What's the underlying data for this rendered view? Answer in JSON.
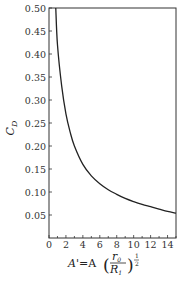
{
  "chart_data": {
    "type": "line",
    "title": "",
    "xlabel": "A' = A(r_0/R_1)^(1/2)",
    "ylabel": "C_D",
    "xlim": [
      0,
      15
    ],
    "ylim": [
      0,
      0.5
    ],
    "x_ticks": [
      0,
      2,
      4,
      6,
      8,
      10,
      12,
      14
    ],
    "x_tick_labels": [
      "0",
      "2",
      "4",
      "6",
      "8",
      "10",
      "12",
      "14"
    ],
    "y_ticks": [
      0.05,
      0.1,
      0.15,
      0.2,
      0.25,
      0.3,
      0.35,
      0.4,
      0.45,
      0.5
    ],
    "y_tick_labels": [
      "0.05",
      "0.10",
      "0.15",
      "0.20",
      "0.25",
      "0.30",
      "0.35",
      "0.40",
      "0.45",
      "0.50"
    ],
    "grid": false,
    "legend": null,
    "series": [
      {
        "name": "C_D",
        "x": [
          0.8,
          1.0,
          1.5,
          2.0,
          2.5,
          3.0,
          4.0,
          5.0,
          6.0,
          7.0,
          8.0,
          9.0,
          10.0,
          11.0,
          12.0,
          13.0,
          14.0,
          15.0
        ],
        "y": [
          0.5,
          0.42,
          0.33,
          0.27,
          0.23,
          0.2,
          0.16,
          0.135,
          0.118,
          0.105,
          0.095,
          0.086,
          0.079,
          0.073,
          0.068,
          0.063,
          0.058,
          0.054
        ]
      }
    ]
  },
  "labels": {
    "ylabel": "C",
    "ylabel_sub": "D",
    "xlabel_A_prime": "A'",
    "xlabel_eq": "=A",
    "xlabel_num": "r",
    "xlabel_num_sub": "0",
    "xlabel_den": "R",
    "xlabel_den_sub": "1",
    "xlabel_exp_num": "1",
    "xlabel_exp_den": "2"
  }
}
